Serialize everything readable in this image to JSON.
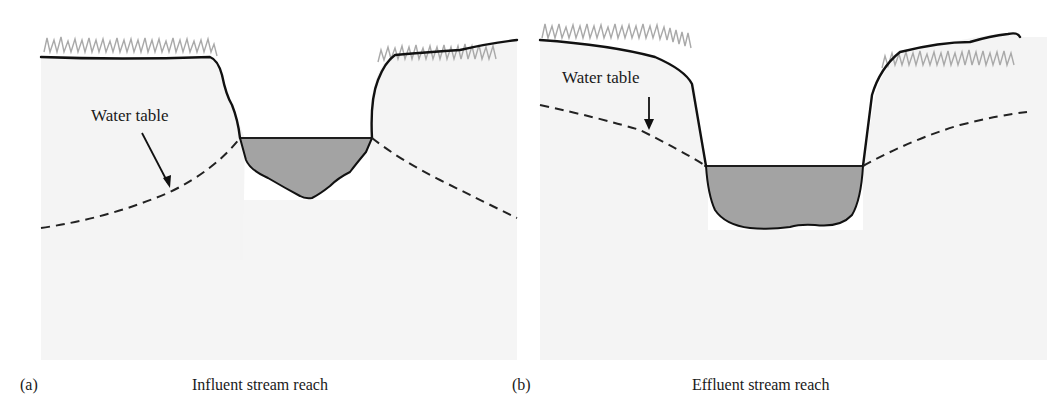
{
  "figure": {
    "panels": [
      {
        "id": "a",
        "tag": "(a)",
        "caption": "Influent stream reach",
        "water_table_label": "Water table",
        "description": "Stream channel above the water table; water table slopes down away from the channel (losing stream)"
      },
      {
        "id": "b",
        "tag": "(b)",
        "caption": "Effluent stream reach",
        "water_table_label": "Water table",
        "description": "Water table slopes down toward the channel and meets the stream surface (gaining stream)"
      }
    ],
    "colors": {
      "soil": "#f4f4f4",
      "water": "#a3a3a3",
      "grass": "#a9a9a9",
      "outline": "#111111"
    }
  }
}
